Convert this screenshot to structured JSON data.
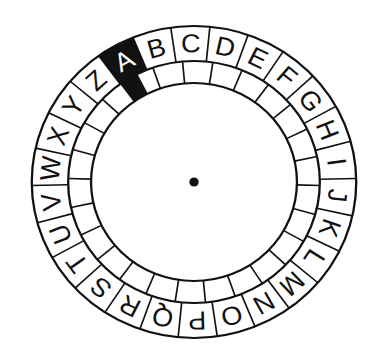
{
  "wheel": {
    "outer_letters": [
      "A",
      "B",
      "C",
      "D",
      "E",
      "F",
      "G",
      "H",
      "I",
      "J",
      "K",
      "L",
      "M",
      "N",
      "O",
      "P",
      "Q",
      "R",
      "S",
      "T",
      "U",
      "V",
      "W",
      "X",
      "Y",
      "Z"
    ],
    "inner_cells": [
      "",
      "",
      "",
      "",
      "",
      "",
      "",
      "",
      "",
      "",
      "",
      "",
      "",
      "",
      "",
      "",
      "",
      "",
      "",
      "",
      "",
      "",
      "",
      "",
      "",
      ""
    ],
    "highlighted_letter": "A",
    "highlighted_index": 0,
    "segment_count": 26,
    "colors": {
      "ink": "#111111",
      "background": "#ffffff"
    }
  }
}
